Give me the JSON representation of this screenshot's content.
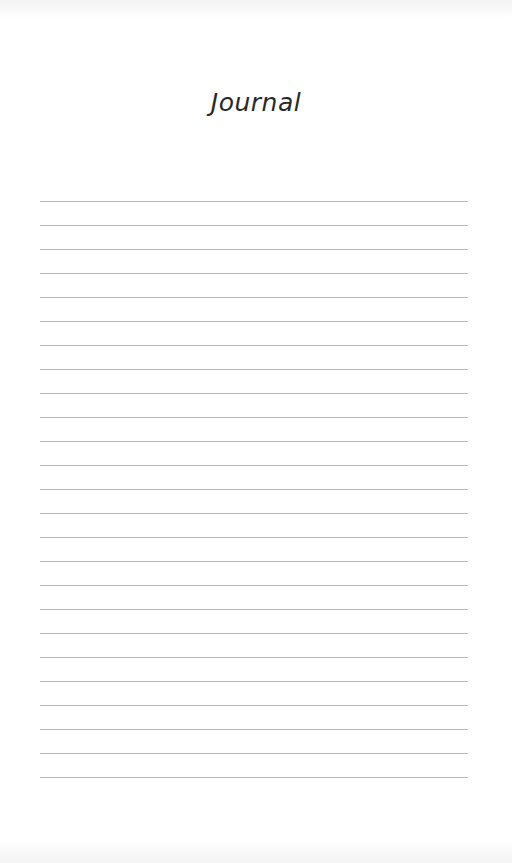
{
  "page": {
    "title": "Journal",
    "line_count": 25,
    "first_line_y": 201,
    "line_spacing": 24,
    "line_color": "#b9b9b9"
  }
}
